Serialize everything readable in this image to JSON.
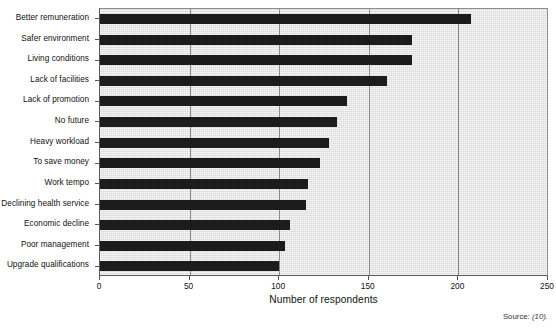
{
  "chart_data": {
    "type": "bar",
    "orientation": "horizontal",
    "title": "",
    "xlabel": "Number of respondents",
    "ylabel": "",
    "xlim": [
      0,
      250
    ],
    "xticks": [
      0,
      50,
      100,
      150,
      200,
      250
    ],
    "xtick_labels": [
      "0",
      "50",
      "100",
      "150",
      "200",
      "250"
    ],
    "grid": "vertical",
    "legend": "none",
    "categories": [
      "Better remuneration",
      "Safer environment",
      "Living conditions",
      "Lack of facilities",
      "Lack of promotion",
      "No future",
      "Heavy workload",
      "To save money",
      "Work tempo",
      "Declining health service",
      "Economic decline",
      "Poor management",
      "Upgrade qualifications"
    ],
    "values": [
      207,
      174,
      174,
      160,
      138,
      132,
      128,
      123,
      116,
      115,
      106,
      103,
      100
    ],
    "bar_color": "#1c1c1c",
    "plot_background": "#d9d9d9",
    "gridline_color": "#8a8a8a"
  },
  "annotations": {
    "source_label": "Source:",
    "source_reference": "(10)."
  }
}
